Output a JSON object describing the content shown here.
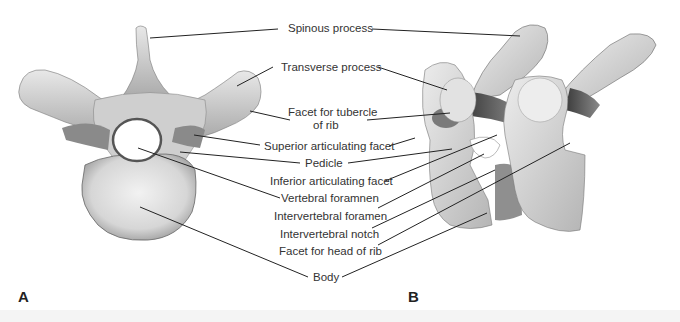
{
  "figure": {
    "panels": [
      {
        "id": "A",
        "label": "A",
        "view": "superior view of vertebra"
      },
      {
        "id": "B",
        "label": "B",
        "view": "lateral view of two articulated vertebrae"
      }
    ],
    "labels": {
      "spinous_process": "Spinous process",
      "transverse_process": "Transverse process",
      "facet_tubercle_line1": "Facet for tubercle",
      "facet_tubercle_line2": "of rib",
      "superior_articulating_facet": "Superior articulating facet",
      "pedicle": "Pedicle",
      "inferior_articulating_facet": "Inferior articulating facet",
      "vertebral_foramen": "Vertebral foramnen",
      "intervertebral_foramen": "Intervertebral foramen",
      "intervertebral_notch": "Intervertebral notch",
      "facet_head_of_rib": "Facet for head of rib",
      "body": "Body"
    },
    "colors": {
      "bone_light": "#e6e6e6",
      "bone_mid": "#bdbdbd",
      "bone_dark": "#6e6e6e",
      "leader_line": "#222222",
      "text": "#333333"
    }
  }
}
